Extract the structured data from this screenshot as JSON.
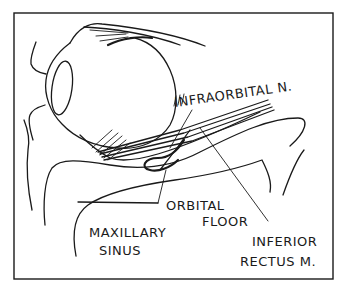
{
  "diagram": {
    "title": "",
    "frame": {
      "stroke": "#1a1a1a",
      "background": "#ffffff"
    },
    "labels": {
      "infraorbital_nerve": "INFRAORBITAL N.",
      "orbital_floor_line1": "ORBITAL",
      "orbital_floor_line2": "FLOOR",
      "maxillary_sinus_line1": "MAXILLARY",
      "maxillary_sinus_line2": "SINUS",
      "inferior_rectus_line1": "INFERIOR",
      "inferior_rectus_line2": "RECTUS M."
    },
    "structures": [
      "eye globe",
      "cornea",
      "eyelids",
      "inferior rectus muscle",
      "infraorbital nerve",
      "orbital floor",
      "maxillary sinus",
      "leader lines"
    ]
  }
}
